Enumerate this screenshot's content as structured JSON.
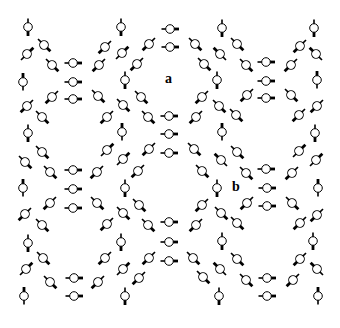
{
  "figure": {
    "type": "molecular lattice diagram",
    "element": {
      "kind": "dipole molecule",
      "parts": [
        "open-circle body",
        "thin stub",
        "thick bar"
      ]
    },
    "labels": {
      "a": "a",
      "b": "b"
    },
    "colors": {
      "stroke": "#000000",
      "fill": "#ffffff",
      "background": "#ffffff"
    }
  }
}
